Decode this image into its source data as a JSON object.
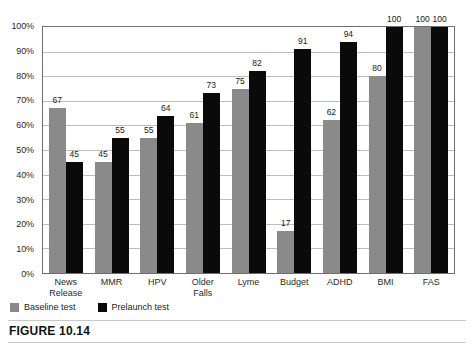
{
  "caption": "FIGURE 10.14",
  "legend": {
    "items": [
      {
        "label": "Baseline test",
        "color": "#8a8a8a",
        "swatch": "baseline-swatch"
      },
      {
        "label": "Prelaunch test",
        "color": "#0a0a0a",
        "swatch": "prelaunch-swatch"
      }
    ]
  },
  "chart_data": {
    "type": "bar",
    "title": "",
    "xlabel": "",
    "ylabel": "",
    "ylim": [
      0,
      100
    ],
    "ytick_labels": [
      "100%",
      "90%",
      "80%",
      "70%",
      "60%",
      "50%",
      "40%",
      "30%",
      "20%",
      "10%",
      "0%"
    ],
    "ytick_values": [
      100,
      90,
      80,
      70,
      60,
      50,
      40,
      30,
      20,
      10,
      0
    ],
    "grid": true,
    "legend_position": "below-left",
    "categories": [
      "News Release",
      "MMR",
      "HPV",
      "Older Falls",
      "Lyme",
      "Budget",
      "ADHD",
      "BMI",
      "FAS"
    ],
    "category_lines": [
      [
        "News",
        "Release"
      ],
      [
        "MMR",
        ""
      ],
      [
        "HPV",
        ""
      ],
      [
        "Older",
        "Falls"
      ],
      [
        "Lyme",
        ""
      ],
      [
        "Budget",
        ""
      ],
      [
        "ADHD",
        ""
      ],
      [
        "BMI",
        ""
      ],
      [
        "FAS",
        ""
      ]
    ],
    "series": [
      {
        "name": "Baseline test",
        "color": "#8a8a8a",
        "values": [
          67,
          45,
          55,
          61,
          75,
          17,
          62,
          80,
          100
        ]
      },
      {
        "name": "Prelaunch test",
        "color": "#0a0a0a",
        "values": [
          45,
          55,
          64,
          73,
          82,
          91,
          94,
          100,
          100
        ]
      }
    ]
  }
}
